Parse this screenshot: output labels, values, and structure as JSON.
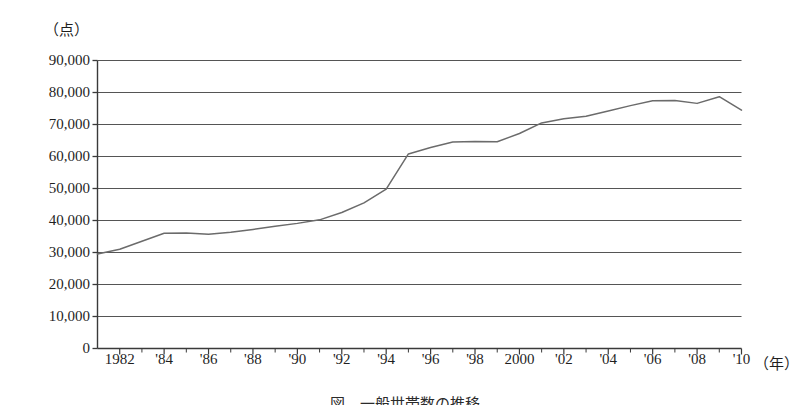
{
  "figure": {
    "y_unit_label": "（点）",
    "x_unit_label": "（年）",
    "caption": "図　一般世帯数の推移",
    "line_color": "#6b6b6b",
    "axis_color": "#3a3a3a",
    "grid_color": "#555555",
    "background_color": "#ffffff"
  },
  "chart_data": {
    "type": "line",
    "title": "図　一般世帯数の推移",
    "xlabel": "（年）",
    "ylabel": "（点）",
    "ylim": [
      0,
      90000
    ],
    "xlim": [
      1981,
      2010
    ],
    "grid": true,
    "legend": "none",
    "y_ticks": [
      0,
      10000,
      20000,
      30000,
      40000,
      50000,
      60000,
      70000,
      80000,
      90000
    ],
    "y_tick_labels": [
      "0",
      "10,000",
      "20,000",
      "30,000",
      "40,000",
      "50,000",
      "60,000",
      "70,000",
      "80,000",
      "90,000"
    ],
    "x_ticks": [
      1982,
      1984,
      1986,
      1988,
      1990,
      1992,
      1994,
      1996,
      1998,
      2000,
      2002,
      2004,
      2006,
      2008,
      2010
    ],
    "x_tick_labels": [
      "1982",
      "'84",
      "'86",
      "'88",
      "'90",
      "'92",
      "'94",
      "'96",
      "'98",
      "2000",
      "'02",
      "'04",
      "'06",
      "'08",
      "'10"
    ],
    "x_minor_ticks": [
      1983,
      1985,
      1987,
      1989,
      1991,
      1993,
      1995,
      1997,
      1999,
      2001,
      2003,
      2005,
      2007,
      2009
    ],
    "series": [
      {
        "name": "点数",
        "x": [
          1981,
          1982,
          1983,
          1984,
          1985,
          1986,
          1987,
          1988,
          1989,
          1990,
          1991,
          1992,
          1993,
          1994,
          1995,
          1996,
          1997,
          1998,
          1999,
          2000,
          2001,
          2002,
          2003,
          2004,
          2005,
          2006,
          2007,
          2008,
          2009,
          2010
        ],
        "values": [
          29500,
          31000,
          33500,
          36000,
          36100,
          35700,
          36300,
          37200,
          38200,
          39100,
          40200,
          42500,
          45500,
          49800,
          60800,
          62800,
          64500,
          64700,
          64600,
          67200,
          70500,
          71800,
          72600,
          74200,
          75900,
          77400,
          77500,
          76600,
          78700,
          74500
        ]
      }
    ]
  }
}
